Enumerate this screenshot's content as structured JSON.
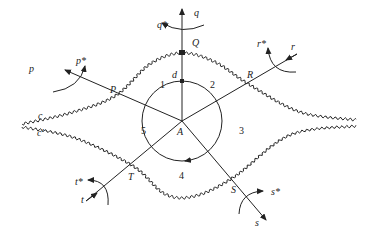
{
  "diagram": {
    "center_label": "A",
    "circle_marker_label": "d",
    "regions": [
      "1",
      "2",
      "3",
      "4",
      "5"
    ],
    "axes": [
      {
        "name": "p",
        "star": "p*",
        "point": "P"
      },
      {
        "name": "q",
        "star": "q*",
        "point": "Q"
      },
      {
        "name": "r",
        "star": "r*",
        "point": "R"
      },
      {
        "name": "s",
        "star": "s*",
        "point": "S"
      },
      {
        "name": "t",
        "star": "t*",
        "point": "T"
      }
    ],
    "curves": {
      "upper": "c",
      "lower": "c′"
    },
    "colors": {
      "line": "#222222",
      "background": "#ffffff"
    }
  }
}
